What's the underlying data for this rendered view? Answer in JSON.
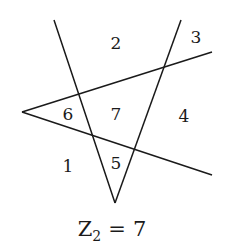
{
  "diagram": {
    "type": "line-arrangement",
    "line_color": "#1a1a1a",
    "lines": [
      {
        "name": "left-v-line",
        "x1": 54,
        "y1": 20,
        "x2": 115,
        "y2": 203
      },
      {
        "name": "right-v-line",
        "x1": 181,
        "y1": 20,
        "x2": 115,
        "y2": 203
      },
      {
        "name": "upper-wedge-line",
        "x1": 22,
        "y1": 112,
        "x2": 212,
        "y2": 52
      },
      {
        "name": "lower-wedge-line",
        "x1": 22,
        "y1": 112,
        "x2": 212,
        "y2": 175
      }
    ],
    "regions": [
      {
        "label": "1",
        "x": 68,
        "y": 172
      },
      {
        "label": "2",
        "x": 116,
        "y": 49
      },
      {
        "label": "3",
        "x": 196,
        "y": 43
      },
      {
        "label": "4",
        "x": 184,
        "y": 122
      },
      {
        "label": "5",
        "x": 116,
        "y": 169
      },
      {
        "label": "6",
        "x": 68,
        "y": 120
      },
      {
        "label": "7",
        "x": 116,
        "y": 120
      }
    ]
  },
  "caption": {
    "variable": "Z",
    "subscript": "2",
    "operator": "=",
    "value": "7"
  }
}
